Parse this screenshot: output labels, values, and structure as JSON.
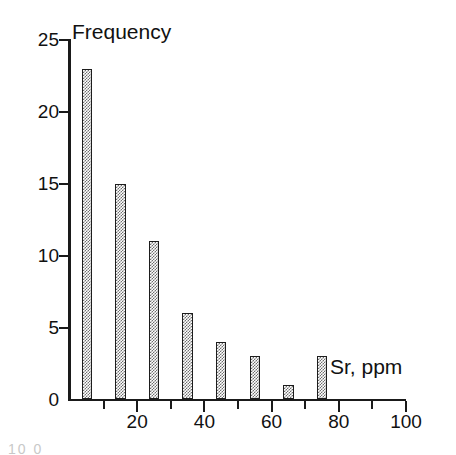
{
  "figure": {
    "background_color": "#ffffff",
    "ink_color": "#1a1a1a",
    "bottom_caption_fragment": "10 0"
  },
  "chart_data": {
    "type": "bar",
    "title": "",
    "subtitle": "",
    "xlabel": "Sr, ppm",
    "ylabel": "Frequency",
    "grid": false,
    "legend": false,
    "legend_position": "none",
    "xlim": [
      0,
      100
    ],
    "ylim": [
      0,
      25
    ],
    "bin_width": 10,
    "categories": [
      "0-10",
      "10-20",
      "20-30",
      "30-40",
      "40-50",
      "50-60",
      "60-70",
      "70-80"
    ],
    "bin_centers": [
      5,
      15,
      25,
      35,
      45,
      55,
      65,
      75
    ],
    "values": [
      23,
      15,
      11,
      6,
      4,
      3,
      1,
      3
    ],
    "x_ticks_major": [
      20,
      40,
      60,
      80,
      100
    ],
    "x_tick_labels": [
      "20",
      "40",
      "60",
      "80",
      "100"
    ],
    "x_ticks_minor": [
      10,
      30,
      50,
      70,
      90
    ],
    "y_ticks": [
      0,
      5,
      10,
      15,
      20,
      25
    ],
    "y_tick_labels": [
      "0",
      "5",
      "10",
      "15",
      "20",
      "25"
    ],
    "bar_fill": "checkerboard-dither",
    "bar_fill_color": "#6f6f6f",
    "bar_edge_color": "#1d1d1d"
  }
}
